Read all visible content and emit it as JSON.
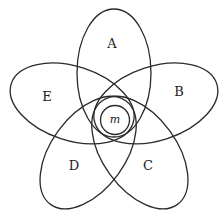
{
  "diagram": {
    "type": "five-set flower (Venn-style) diagram",
    "center": {
      "x": 114,
      "y": 117
    },
    "petal_geometry": {
      "offset": 44,
      "rx": 37,
      "ry": 64
    },
    "petals": [
      {
        "label": "A",
        "angle": 0,
        "label_pos": {
          "x": 112,
          "y": 44
        }
      },
      {
        "label": "B",
        "angle": 72,
        "label_pos": {
          "x": 179,
          "y": 92
        }
      },
      {
        "label": "C",
        "angle": 144,
        "label_pos": {
          "x": 148,
          "y": 166
        }
      },
      {
        "label": "D",
        "angle": 216,
        "label_pos": {
          "x": 74,
          "y": 166
        }
      },
      {
        "label": "E",
        "angle": 288,
        "label_pos": {
          "x": 47,
          "y": 97
        }
      }
    ],
    "center_circle": {
      "label": "m",
      "cx": 115,
      "cy": 120,
      "r": 14.5
    },
    "stroke_color": "#2a2a2a",
    "background": "#ffffff"
  }
}
